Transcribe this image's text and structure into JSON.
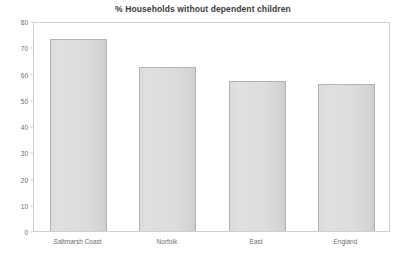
{
  "chart_data": {
    "type": "bar",
    "title": "% Households without dependent children",
    "xlabel": "",
    "ylabel": "",
    "categories": [
      "Saltmarsh Coast",
      "Norfolk",
      "East",
      "England"
    ],
    "values": [
      73,
      62.5,
      57,
      56
    ],
    "ylim": [
      0,
      80
    ],
    "yticks": [
      0,
      10,
      20,
      30,
      40,
      50,
      60,
      70,
      80
    ],
    "ytick_labels": [
      "0",
      "10",
      "20",
      "30",
      "40",
      "50",
      "60",
      "70",
      "80"
    ],
    "grid": false,
    "legend": null,
    "bar_fill_color": "#dcdcdc",
    "bar_border_color": "#b2b2b2",
    "plot_border_color": "#cfcfcf",
    "text_color": "#6e6e6e",
    "background_color": "#ffffff"
  }
}
